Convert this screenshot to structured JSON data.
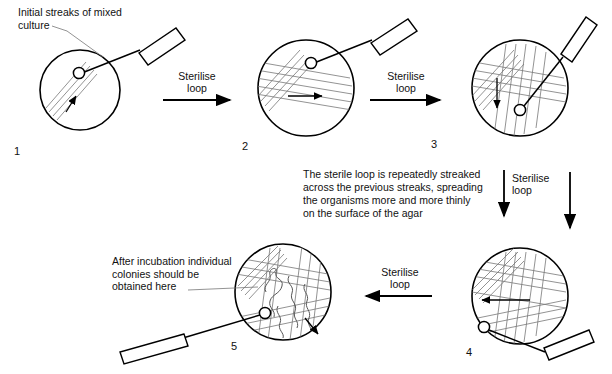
{
  "figure": {
    "title_note": "Streak plate dilution method diagram",
    "background": "#ffffff",
    "line_color": "#000000",
    "streak_color": "#555555"
  },
  "annotations": {
    "initial": "Initial streaks of mixed\nculture",
    "middle_block": "The sterile loop is repeatedly streaked\nacross the previous streaks, spreading\nthe organisms more and more thinly\non the surface of the agar",
    "colonies": "After incubation individual\ncolonies should be\nobtained here"
  },
  "arrows": [
    {
      "id": "arrow-1-2",
      "label": "Sterilise\nloop",
      "direction": "right"
    },
    {
      "id": "arrow-2-3",
      "label": "Sterilise\nloop",
      "direction": "right"
    },
    {
      "id": "arrow-3-4",
      "label": "Sterilise\nloop",
      "direction": "down"
    },
    {
      "id": "arrow-4-5",
      "label": "Sterilise\nloop",
      "direction": "left"
    }
  ],
  "plates": [
    {
      "number": "1",
      "name": "plate-1"
    },
    {
      "number": "2",
      "name": "plate-2"
    },
    {
      "number": "3",
      "name": "plate-3"
    },
    {
      "number": "4",
      "name": "plate-4"
    },
    {
      "number": "5",
      "name": "plate-5"
    }
  ]
}
